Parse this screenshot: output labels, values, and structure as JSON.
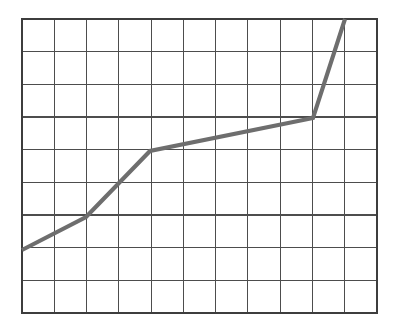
{
  "figure": {
    "name": "line-graph-on-grid",
    "background_color": "#ffffff",
    "width": 396,
    "height": 327
  },
  "chart_data": {
    "type": "line",
    "title": "",
    "subtitle": "",
    "xlabel": "",
    "ylabel": "",
    "xlim": [
      0,
      11
    ],
    "ylim": [
      0,
      9
    ],
    "grid": true,
    "grid_columns": 11,
    "grid_rows": 9,
    "grid_color": "#4d4d4d",
    "border_color": "#3d3d3d",
    "legend": null,
    "legend_position": "none",
    "xticks": [
      0,
      1,
      2,
      3,
      4,
      5,
      6,
      7,
      8,
      9,
      10,
      11
    ],
    "yticks": [
      0,
      1,
      2,
      3,
      4,
      5,
      6,
      7,
      8,
      9
    ],
    "xticklabels": [],
    "yticklabels": [],
    "annotations": [],
    "series": [
      {
        "name": "trend",
        "color": "#6e6e6e",
        "line_width": 4,
        "marker": "none",
        "x": [
          0,
          2,
          3,
          4,
          9,
          10
        ],
        "y": [
          1.95,
          2.95,
          4.0,
          5.0,
          6.0,
          9.0
        ],
        "points": [
          {
            "x": 0,
            "y": 1.95,
            "px": 22,
            "py": 250
          },
          {
            "x": 2,
            "y": 2.95,
            "px": 86,
            "py": 217
          },
          {
            "x": 3,
            "y": 4.0,
            "px": 118,
            "py": 184
          },
          {
            "x": 4,
            "y": 5.0,
            "px": 150,
            "py": 151
          },
          {
            "x": 9,
            "y": 6.0,
            "px": 313,
            "py": 118
          },
          {
            "x": 10,
            "y": 9.0,
            "px": 345,
            "py": 19
          }
        ]
      }
    ],
    "plot_area_px": {
      "left": 22,
      "top": 19,
      "right": 377,
      "bottom": 313
    },
    "cell_width_px": 32.27,
    "cell_height_px": 32.67,
    "description": "A rising polyline plotted over a plain 11 by 9 square grid with no axis labels. It climbs steeply from the lower left, eases to a gentle near-flat slope across the middle, then turns sharply upward to reach the top right."
  }
}
